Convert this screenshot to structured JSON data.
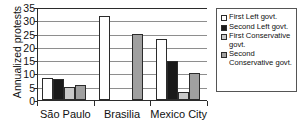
{
  "chart_data": {
    "type": "bar",
    "title": "",
    "xlabel": "",
    "ylabel": "Annualized protests",
    "categories": [
      "São Paulo",
      "Brasilia",
      "Mexico City"
    ],
    "ylim": [
      0,
      35
    ],
    "ytick_labels": [
      "0",
      "5",
      "10",
      "15",
      "20",
      "25",
      "30",
      "35"
    ],
    "ytick_values": [
      0,
      5,
      10,
      15,
      20,
      25,
      30,
      35
    ],
    "grid": true,
    "legend_position": "right",
    "series": [
      {
        "name": "First Left govt.",
        "fill": "#ffffff",
        "values": [
          8.2,
          31.5,
          23.0
        ]
      },
      {
        "name": "Second Left govt.",
        "fill": "#1a1a1a",
        "values": [
          8.0,
          null,
          14.5
        ]
      },
      {
        "name": "First Conservative govt.",
        "fill": "#c9c9c9",
        "values": [
          4.8,
          null,
          3.0
        ]
      },
      {
        "name": "Second Conservative govt.",
        "fill": "#a0a0a0",
        "values": [
          5.5,
          24.7,
          10.0
        ]
      }
    ]
  },
  "legend": {
    "items": [
      {
        "label": "First Left govt."
      },
      {
        "label": "Second Left govt."
      },
      {
        "label": "First Conservative govt."
      },
      {
        "label": "Second Conservative govt."
      }
    ]
  },
  "colors": {
    "axis": "#2b2b2b",
    "gridline": "#8e8e8e",
    "text": "#111111",
    "background": "#ffffff"
  }
}
